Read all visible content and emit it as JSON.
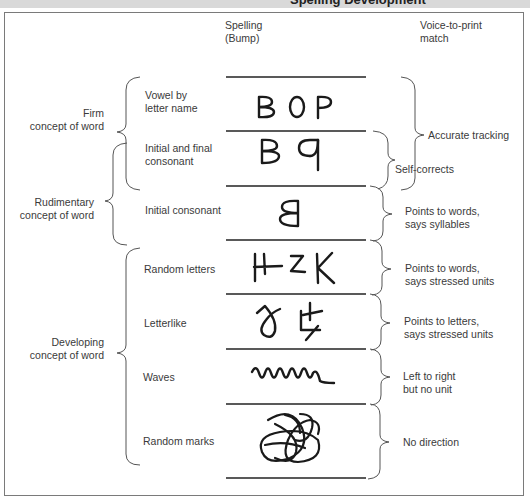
{
  "header": {
    "title": "Spelling Development"
  },
  "columns": {
    "spelling": {
      "line1": "Spelling",
      "line2": "(Bump)"
    },
    "voice": {
      "line1": "Voice-to-print",
      "line2": "match"
    }
  },
  "concept_groups": [
    {
      "line1": "Firm",
      "line2": "concept of word"
    },
    {
      "line1": "Rudimentary",
      "line2": "concept of word"
    },
    {
      "line1": "Developing",
      "line2": "concept of word"
    }
  ],
  "stages": [
    {
      "line1": "Vowel by",
      "line2": "letter name",
      "sample": "BOP"
    },
    {
      "line1": "Initial and final",
      "line2": "consonant",
      "sample": "B q"
    },
    {
      "line1": "Initial consonant",
      "line2": "",
      "sample": "B (reversed)"
    },
    {
      "line1": "Random letters",
      "line2": "",
      "sample": "HZK"
    },
    {
      "line1": "Letterlike",
      "line2": "",
      "sample": "letterlike marks"
    },
    {
      "line1": "Waves",
      "line2": "",
      "sample": "wavy line"
    },
    {
      "line1": "Random marks",
      "line2": "",
      "sample": "scribble"
    }
  ],
  "voice_match": [
    {
      "line1": "Accurate tracking",
      "line2": ""
    },
    {
      "line1": "Self-corrects",
      "line2": ""
    },
    {
      "line1": "Points to words,",
      "line2": "says syllables"
    },
    {
      "line1": "Points to words,",
      "line2": "says stressed units"
    },
    {
      "line1": "Points to letters,",
      "line2": "says stressed units"
    },
    {
      "line1": "Left to right",
      "line2": "but no unit"
    },
    {
      "line1": "No direction",
      "line2": ""
    }
  ]
}
